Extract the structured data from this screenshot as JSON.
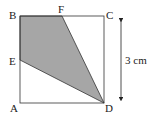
{
  "diagram": {
    "type": "geometry-square",
    "points": {
      "A": {
        "label": "A",
        "x": 20,
        "y": 103
      },
      "B": {
        "label": "B",
        "x": 20,
        "y": 16
      },
      "C": {
        "label": "C",
        "x": 104,
        "y": 16
      },
      "D": {
        "label": "D",
        "x": 104,
        "y": 103
      },
      "E": {
        "label": "E",
        "x": 20,
        "y": 60
      },
      "F": {
        "label": "F",
        "x": 62,
        "y": 16
      }
    },
    "shaded_region": [
      "B",
      "F",
      "D",
      "E"
    ],
    "shade_color": "#a6a6a6",
    "line_color": "#333333",
    "dimension": {
      "label": "3 cm",
      "side": "CD"
    }
  }
}
